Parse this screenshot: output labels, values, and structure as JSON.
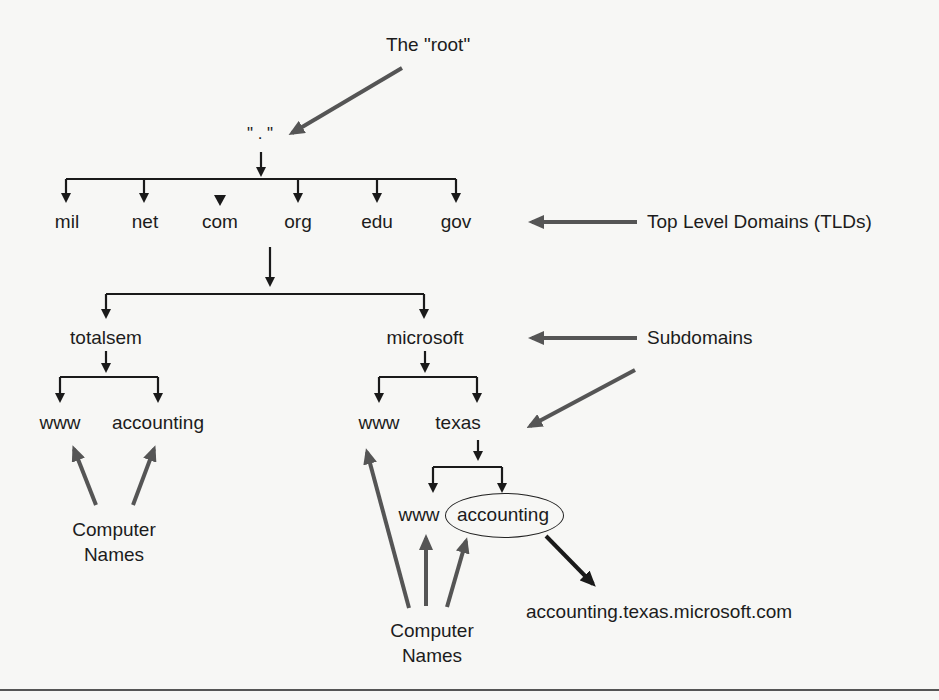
{
  "diagram": {
    "root": {
      "callout": "The \"root\"",
      "symbol": "\" . \""
    },
    "tlds": [
      "mil",
      "net",
      "com",
      "org",
      "edu",
      "gov"
    ],
    "second_level": [
      "totalsem",
      "microsoft"
    ],
    "totalsem_children": [
      "www",
      "accounting"
    ],
    "microsoft_children": [
      "www",
      "texas"
    ],
    "texas_children": [
      "www",
      "accounting"
    ],
    "annotations": {
      "tlds": "Top Level Domains (TLDs)",
      "subdomains": "Subdomains",
      "computer_names_1": "Computer\nNames",
      "computer_names_2": "Computer\nNames",
      "fqdn": "accounting.texas.microsoft.com"
    },
    "highlighted_node": "accounting",
    "colors": {
      "tree_line": "#1a1a1a",
      "callout_arrow": "#555555",
      "background": "#f7f7f5"
    }
  }
}
